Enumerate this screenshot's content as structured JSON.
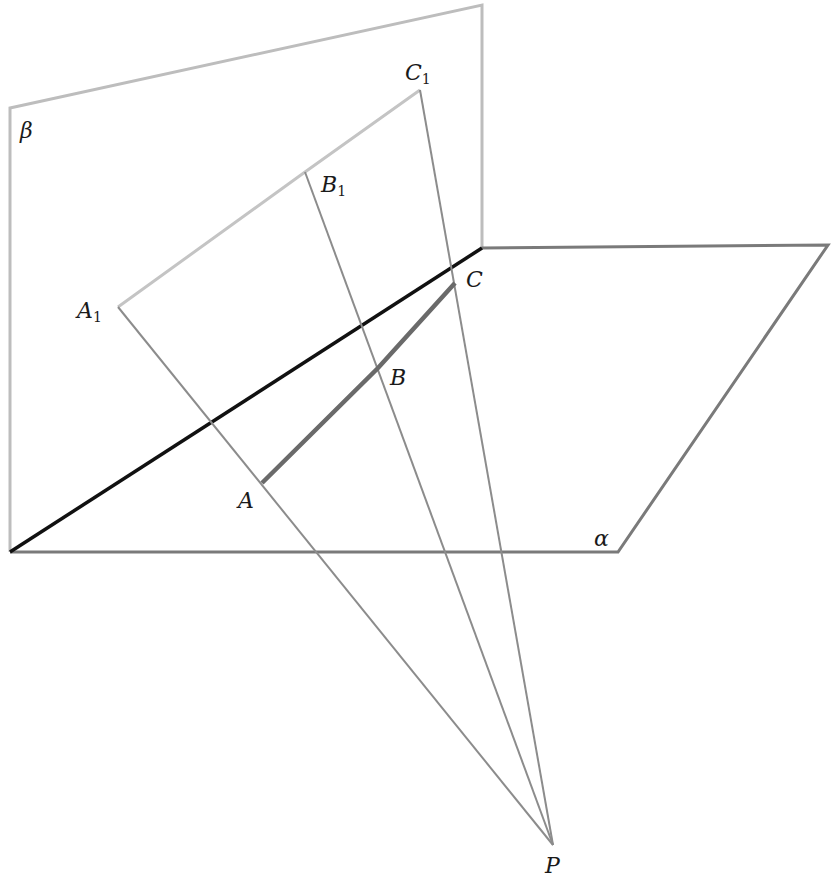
{
  "diagram": {
    "type": "geometry-projection",
    "planes": {
      "beta": {
        "label": "β",
        "points": [
          [
            10,
            108
          ],
          [
            482,
            5
          ],
          [
            482,
            248
          ],
          [
            10,
            552
          ]
        ],
        "color": "#b8b8b8"
      },
      "alpha": {
        "label": "α",
        "points": [
          [
            10,
            552
          ],
          [
            482,
            248
          ],
          [
            828,
            245
          ],
          [
            618,
            552
          ]
        ],
        "color": "#7a7a7a"
      }
    },
    "intersection_line": {
      "from": [
        10,
        552
      ],
      "to": [
        482,
        248
      ],
      "color": "#111111"
    },
    "labels": {
      "beta": "β",
      "alpha": "α",
      "A1": {
        "main": "A",
        "sub": "1"
      },
      "B1": {
        "main": "B",
        "sub": "1"
      },
      "C1": {
        "main": "C",
        "sub": "1"
      },
      "A": "A",
      "B": "B",
      "C": "C",
      "P": "P"
    },
    "points": {
      "A1": [
        118,
        307
      ],
      "B1": [
        305,
        172
      ],
      "C1": [
        420,
        90
      ],
      "A": [
        262,
        483
      ],
      "B": [
        378,
        368
      ],
      "C": [
        455,
        283
      ],
      "P": [
        553,
        845
      ]
    },
    "colors": {
      "projection_lines": "#8a8a8a",
      "segment_ABC": "#6e6e6e",
      "segment_A1B1C1": "#c0c0c0"
    }
  }
}
